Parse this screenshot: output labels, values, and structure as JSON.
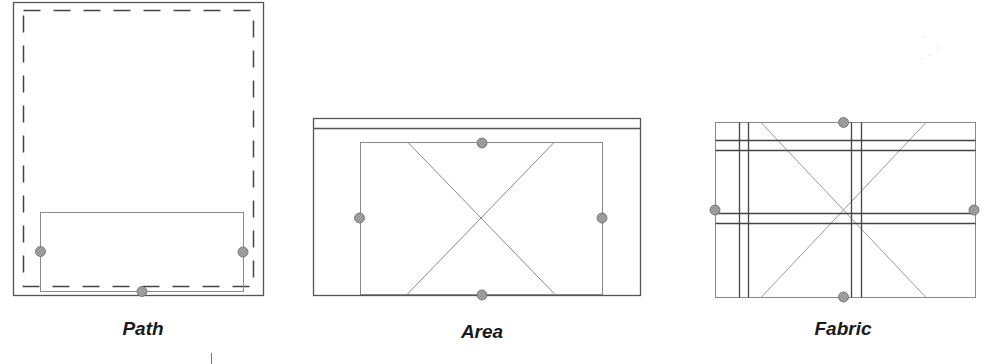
{
  "diagrams": [
    {
      "id": "path",
      "label": "Path",
      "label_pos": {
        "x": 143,
        "y": 318
      }
    },
    {
      "id": "area",
      "label": "Area",
      "label_pos": {
        "x": 482,
        "y": 321
      }
    },
    {
      "id": "fabric",
      "label": "Fabric",
      "label_pos": {
        "x": 843,
        "y": 318
      }
    }
  ],
  "colors": {
    "outline": "#444444",
    "thin_line": "#888888",
    "dot_fill": "#9a9a9a",
    "dot_stroke": "#6a6a6a",
    "label": "#1a1a1a"
  }
}
